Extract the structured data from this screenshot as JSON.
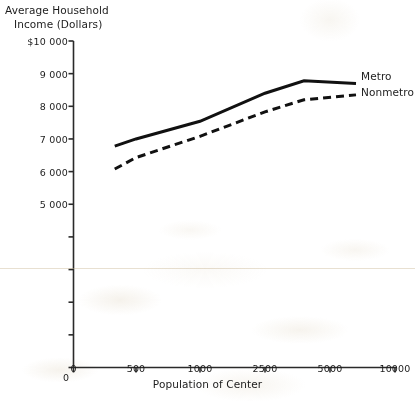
{
  "chart_data": {
    "type": "line",
    "title": "",
    "ylabel": "Average Household Income (Dollars)",
    "ylabel_line1": "Average Household",
    "ylabel_line2": "Income (Dollars)",
    "xlabel": "Population of Center",
    "x_categories": [
      "0",
      "500",
      "1000",
      "2500",
      "5000",
      "10000"
    ],
    "x_tick_labels": [
      "0",
      "500",
      "1000",
      "2500",
      "5000",
      "10000"
    ],
    "y_tick_labels": [
      "$10 000",
      "9 000",
      "8 000",
      "7 000",
      "6 000",
      "5 000",
      "",
      "",
      "",
      "",
      "0"
    ],
    "y_tick_values": [
      10000,
      9000,
      8000,
      7000,
      6000,
      5000,
      4000,
      3000,
      2000,
      1000,
      0
    ],
    "ylim": [
      0,
      10000
    ],
    "grid": false,
    "legend_position": "right-of-line-ends",
    "series": [
      {
        "name": "Metro",
        "style": "solid",
        "color": "#111111",
        "x": [
          330,
          500,
          1000,
          2500,
          4000,
          7000
        ],
        "values": [
          6780,
          7000,
          7540,
          8400,
          8780,
          8700
        ]
      },
      {
        "name": "Nonmetro",
        "style": "dashed",
        "color": "#111111",
        "x": [
          330,
          500,
          1000,
          2500,
          4000,
          7000
        ],
        "values": [
          6080,
          6430,
          7080,
          7830,
          8200,
          8350
        ]
      }
    ]
  },
  "axes": {
    "y_title_line1": "Average Household",
    "y_title_line2": "Income (Dollars)",
    "x_title": "Population of Center"
  },
  "y_ticks": [
    {
      "label": "$10 000",
      "value": 10000
    },
    {
      "label": "9 000",
      "value": 9000
    },
    {
      "label": "8 000",
      "value": 8000
    },
    {
      "label": "7 000",
      "value": 7000
    },
    {
      "label": "6 000",
      "value": 6000
    },
    {
      "label": "5 000",
      "value": 5000
    },
    {
      "label": "",
      "value": 4000
    },
    {
      "label": "",
      "value": 3000
    },
    {
      "label": "",
      "value": 2000
    },
    {
      "label": "",
      "value": 1000
    },
    {
      "label": "0",
      "value": 0
    }
  ],
  "x_ticks": [
    {
      "label": "0",
      "value": 0
    },
    {
      "label": "500",
      "value": 500
    },
    {
      "label": "1000",
      "value": 1000
    },
    {
      "label": "2500",
      "value": 2500
    },
    {
      "label": "5000",
      "value": 5000
    },
    {
      "label": "10000",
      "value": 10000
    }
  ],
  "series_labels": {
    "metro": "Metro",
    "nonmetro": "Nonmetro"
  }
}
